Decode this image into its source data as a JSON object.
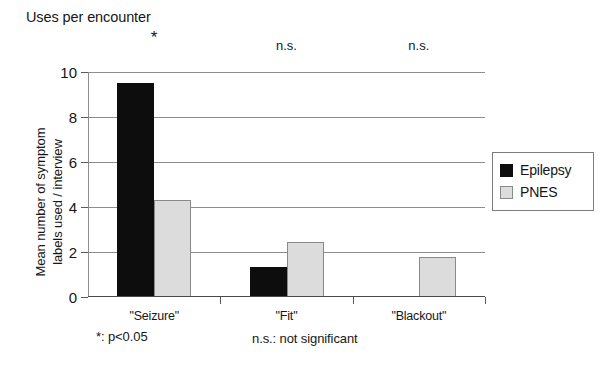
{
  "chart_data": {
    "type": "bar",
    "title": "Uses per encounter",
    "xlabel": "",
    "ylabel": "Mean number of symptom\nlabels used / interview",
    "categories": [
      "\"Seizure\"",
      "\"Fit\"",
      "\"Blackout\""
    ],
    "series": [
      {
        "name": "Epilepsy",
        "color": "#0d0d0d",
        "values": [
          9.5,
          1.35,
          0
        ]
      },
      {
        "name": "PNES",
        "color": "#dcdcdc",
        "values": [
          4.3,
          2.45,
          1.8
        ]
      }
    ],
    "ylim": [
      0,
      10
    ],
    "yticks": [
      0,
      2,
      4,
      6,
      8,
      10
    ],
    "ytick_labels": [
      "0",
      "2",
      "4",
      "6",
      "8",
      "10"
    ],
    "grid": true,
    "legend_position": "right",
    "annotations": [
      "*",
      "n.s.",
      "n.s."
    ],
    "footnotes": {
      "star": "*: p<0.05",
      "ns": "n.s.: not significant"
    }
  }
}
